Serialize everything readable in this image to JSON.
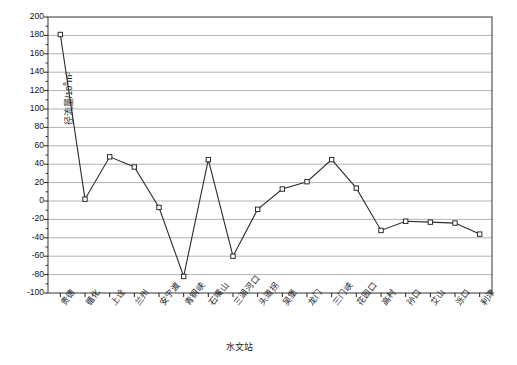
{
  "chart_data": {
    "type": "line",
    "title": "",
    "xlabel": "水文站",
    "ylabel": "径流量/10⁸m³",
    "ylabel_base": "径流量/10",
    "ylabel_sup": "8",
    "ylabel_tail": "m³",
    "categories": [
      "贵德",
      "循化",
      "上诠",
      "兰州",
      "安宁渡",
      "青铜峡",
      "石嘴山",
      "三湖河口",
      "头道拐",
      "吴堡",
      "龙门",
      "三门峡",
      "花园口",
      "高村",
      "孙口",
      "艾山",
      "泺口",
      "利津"
    ],
    "values": [
      181,
      2,
      48,
      37,
      -7,
      -82,
      45,
      -60,
      -9,
      13,
      21,
      45,
      14,
      -32,
      -22,
      -23,
      -24,
      -36
    ],
    "ylim": [
      -100,
      200
    ],
    "yticks": [
      200,
      180,
      160,
      140,
      120,
      100,
      80,
      60,
      40,
      20,
      0,
      -20,
      -40,
      -60,
      -80,
      -100
    ],
    "ytick_labels": [
      "200",
      "180",
      "160",
      "140",
      "120",
      "100",
      "80",
      "60",
      "40",
      "20",
      "0",
      "-20",
      "-40",
      "-60",
      "-80",
      "-100"
    ],
    "grid": true,
    "grid_axis": "y",
    "legend": false,
    "legend_position": "none",
    "marker": "open-square",
    "line_color": "#2b2b2b",
    "grid_color": "#b3b3b3",
    "frame_color": "#555555",
    "marker_fill": "#ffffff",
    "series": [
      {
        "name": "径流量",
        "values": [
          181,
          2,
          48,
          37,
          -7,
          -82,
          45,
          -60,
          -9,
          13,
          21,
          45,
          14,
          -32,
          -22,
          -23,
          -24,
          -36
        ]
      }
    ]
  },
  "axes": {
    "y_axis_name": "runoff-axis",
    "x_axis_name": "station-axis"
  }
}
